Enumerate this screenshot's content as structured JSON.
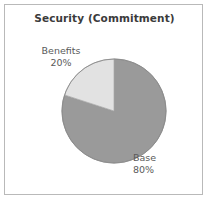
{
  "chart_data": {
    "type": "pie",
    "title": "Security (Commitment)",
    "categories": [
      "Base",
      "Benefits"
    ],
    "values": [
      80,
      20
    ],
    "value_unit": "%",
    "labels": [
      {
        "name": "Base",
        "value": "80%",
        "percent": 80,
        "color": "#9a9a9a"
      },
      {
        "name": "Benefits",
        "value": "20%",
        "percent": 20,
        "color": "#e2e2e2"
      }
    ],
    "start_angle_deg": 0,
    "direction": "clockwise",
    "legend": "none",
    "grid": false,
    "xlabel": "",
    "ylabel": ""
  },
  "frame": {
    "border_color": "#b9b9b9",
    "background": "#ffffff"
  },
  "geometry": {
    "center_x": 109,
    "center_y": 106,
    "radius": 52
  },
  "icons": {
    "pie_chart": "pie-chart-icon"
  }
}
